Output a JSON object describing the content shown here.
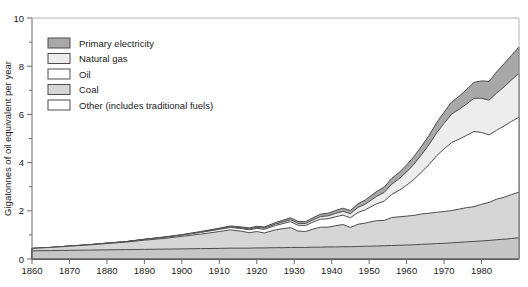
{
  "chart_data": {
    "type": "area",
    "stacked": true,
    "title": "",
    "subtitle": "",
    "xlabel": "",
    "ylabel": "Gigatonnes of oil equivalent per year",
    "xlim": [
      1860,
      1990
    ],
    "ylim": [
      0,
      10
    ],
    "grid": false,
    "legend_position": "top-left",
    "x_ticks": [
      1860,
      1870,
      1880,
      1890,
      1900,
      1910,
      1920,
      1930,
      1940,
      1950,
      1960,
      1970,
      1980
    ],
    "x_tick_labels": [
      "1860",
      "1870",
      "1880",
      "1890",
      "1900",
      "1910",
      "1920",
      "1930",
      "1940",
      "1950",
      "1960",
      "1970",
      "1980"
    ],
    "y_ticks": [
      0,
      2,
      4,
      6,
      8,
      10
    ],
    "y_tick_labels": [
      "0",
      "2",
      "4",
      "6",
      "8",
      "10"
    ],
    "y_minor_ticks": [
      1,
      3,
      5,
      7,
      9
    ],
    "x": [
      1860,
      1865,
      1870,
      1875,
      1880,
      1885,
      1890,
      1895,
      1900,
      1905,
      1910,
      1913,
      1916,
      1918,
      1920,
      1922,
      1925,
      1927,
      1929,
      1931,
      1933,
      1935,
      1937,
      1939,
      1941,
      1943,
      1945,
      1947,
      1949,
      1950,
      1952,
      1954,
      1956,
      1958,
      1960,
      1962,
      1964,
      1966,
      1968,
      1970,
      1972,
      1974,
      1976,
      1978,
      1980,
      1982,
      1984,
      1986,
      1988,
      1990
    ],
    "series": [
      {
        "name": "Other (includes traditional fuels)",
        "color": "#c6c6c6",
        "values": [
          0.34,
          0.35,
          0.36,
          0.37,
          0.38,
          0.39,
          0.4,
          0.41,
          0.42,
          0.43,
          0.44,
          0.45,
          0.45,
          0.45,
          0.46,
          0.46,
          0.47,
          0.47,
          0.48,
          0.48,
          0.48,
          0.49,
          0.49,
          0.5,
          0.5,
          0.51,
          0.51,
          0.52,
          0.53,
          0.53,
          0.54,
          0.55,
          0.56,
          0.57,
          0.58,
          0.59,
          0.61,
          0.62,
          0.64,
          0.65,
          0.67,
          0.69,
          0.71,
          0.73,
          0.75,
          0.77,
          0.8,
          0.82,
          0.85,
          0.88
        ]
      },
      {
        "name": "Coal",
        "color": "#d6d6d6",
        "values": [
          0.1,
          0.13,
          0.17,
          0.21,
          0.26,
          0.31,
          0.38,
          0.44,
          0.52,
          0.6,
          0.7,
          0.76,
          0.7,
          0.64,
          0.68,
          0.62,
          0.74,
          0.79,
          0.82,
          0.68,
          0.66,
          0.75,
          0.83,
          0.82,
          0.88,
          0.92,
          0.8,
          0.92,
          0.96,
          1.0,
          1.05,
          1.05,
          1.16,
          1.18,
          1.2,
          1.22,
          1.26,
          1.28,
          1.3,
          1.32,
          1.34,
          1.38,
          1.42,
          1.44,
          1.52,
          1.58,
          1.68,
          1.74,
          1.82,
          1.9
        ]
      },
      {
        "name": "Oil",
        "color": "#ffffff",
        "values": [
          0.0,
          0.0,
          0.01,
          0.01,
          0.02,
          0.02,
          0.03,
          0.04,
          0.05,
          0.07,
          0.09,
          0.1,
          0.11,
          0.12,
          0.13,
          0.15,
          0.18,
          0.21,
          0.25,
          0.24,
          0.25,
          0.29,
          0.33,
          0.35,
          0.37,
          0.39,
          0.4,
          0.49,
          0.55,
          0.6,
          0.7,
          0.8,
          0.96,
          1.1,
          1.28,
          1.5,
          1.74,
          2.02,
          2.34,
          2.6,
          2.82,
          2.9,
          3.0,
          3.12,
          2.98,
          2.8,
          2.86,
          2.96,
          3.04,
          3.1
        ]
      },
      {
        "name": "Natural gas",
        "color": "#ededed",
        "values": [
          0.0,
          0.0,
          0.0,
          0.0,
          0.0,
          0.0,
          0.01,
          0.01,
          0.01,
          0.02,
          0.02,
          0.03,
          0.03,
          0.04,
          0.04,
          0.05,
          0.06,
          0.07,
          0.08,
          0.08,
          0.08,
          0.09,
          0.11,
          0.12,
          0.14,
          0.16,
          0.17,
          0.21,
          0.24,
          0.26,
          0.31,
          0.36,
          0.42,
          0.48,
          0.55,
          0.63,
          0.72,
          0.83,
          0.95,
          1.06,
          1.18,
          1.24,
          1.3,
          1.38,
          1.42,
          1.44,
          1.54,
          1.62,
          1.72,
          1.82
        ]
      },
      {
        "name": "Primary electricity",
        "color": "#a8a8a8",
        "values": [
          0.0,
          0.0,
          0.0,
          0.0,
          0.0,
          0.0,
          0.0,
          0.01,
          0.01,
          0.02,
          0.03,
          0.03,
          0.04,
          0.04,
          0.05,
          0.05,
          0.06,
          0.07,
          0.08,
          0.08,
          0.08,
          0.09,
          0.1,
          0.11,
          0.12,
          0.13,
          0.13,
          0.15,
          0.17,
          0.18,
          0.2,
          0.22,
          0.24,
          0.26,
          0.29,
          0.32,
          0.35,
          0.38,
          0.42,
          0.46,
          0.5,
          0.54,
          0.6,
          0.66,
          0.72,
          0.78,
          0.88,
          0.96,
          1.02,
          1.1
        ]
      }
    ]
  },
  "legend": {
    "items": [
      {
        "label": "Primary electricity",
        "color": "#a8a8a8"
      },
      {
        "label": "Natural gas",
        "color": "#ededed"
      },
      {
        "label": "Oil",
        "color": "#ffffff"
      },
      {
        "label": "Coal",
        "color": "#d6d6d6"
      },
      {
        "label": "Other (includes traditional fuels)",
        "color": "#ffffff"
      }
    ]
  },
  "axes": {
    "y_title": "Gigatonnes of oil equivalent per year"
  }
}
